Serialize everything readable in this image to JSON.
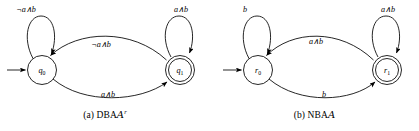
{
  "figure": {
    "panels": [
      {
        "id": "dba",
        "caption_index": "(a)",
        "caption_kind": "DBA",
        "caption_script": "A",
        "caption_superscript": "r",
        "states": [
          {
            "name": "q",
            "subscript": "0",
            "accepting": false,
            "initial": true
          },
          {
            "name": "q",
            "subscript": "1",
            "accepting": true,
            "initial": false
          }
        ],
        "transitions": [
          {
            "from": "q0",
            "to": "q0",
            "kind": "self-loop",
            "label": "¬a∧b"
          },
          {
            "from": "q1",
            "to": "q1",
            "kind": "self-loop",
            "label": "a∧b"
          },
          {
            "from": "q1",
            "to": "q0",
            "kind": "arc-upper",
            "label": "¬a∧b"
          },
          {
            "from": "q0",
            "to": "q1",
            "kind": "arc-lower",
            "label": "a∧b"
          }
        ]
      },
      {
        "id": "nba",
        "caption_index": "(b)",
        "caption_kind": "NBA",
        "caption_script": "A",
        "caption_superscript": "",
        "states": [
          {
            "name": "r",
            "subscript": "0",
            "accepting": false,
            "initial": true
          },
          {
            "name": "r",
            "subscript": "1",
            "accepting": true,
            "initial": false
          }
        ],
        "transitions": [
          {
            "from": "r0",
            "to": "r0",
            "kind": "self-loop",
            "label": "b"
          },
          {
            "from": "r1",
            "to": "r1",
            "kind": "self-loop",
            "label": "a∧b"
          },
          {
            "from": "r1",
            "to": "r0",
            "kind": "arc-upper",
            "label": "a∧b"
          },
          {
            "from": "r0",
            "to": "r1",
            "kind": "arc-lower",
            "label": "b"
          }
        ]
      }
    ],
    "colors": {
      "ink": "#000000",
      "paper": "#ffffff"
    }
  }
}
